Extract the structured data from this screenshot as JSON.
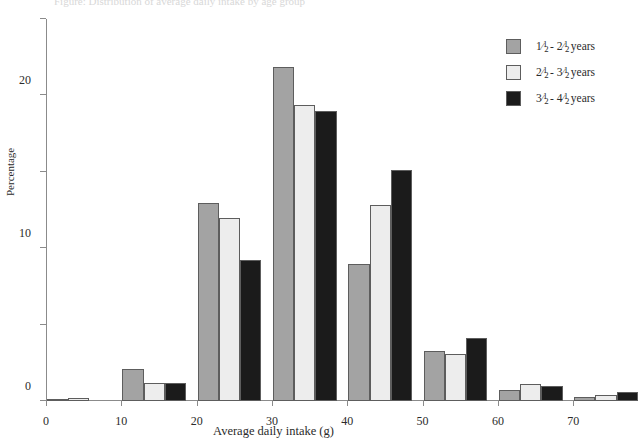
{
  "title_strip": "Figure: Distribution of average daily intake by age group",
  "axes": {
    "y_title": "Percentage",
    "x_title": "Average daily intake (g)",
    "y_ticks": [
      0,
      10,
      20,
      30,
      40,
      50
    ],
    "x_ticks": [
      0,
      10,
      20,
      30,
      40,
      50,
      60,
      70
    ]
  },
  "legend": {
    "items": [
      {
        "label": "1 1/2 - 2 1/2 years",
        "a_whole": "1",
        "a_num": "1",
        "a_den": "2",
        "b_whole": "2",
        "b_num": "1",
        "b_den": "2",
        "suffix": " years",
        "dash": " - ",
        "color": "#a3a3a3"
      },
      {
        "label": "2 1/2 - 3 1/2 years",
        "a_whole": "2",
        "a_num": "1",
        "a_den": "2",
        "b_whole": "3",
        "b_num": "1",
        "b_den": "2",
        "suffix": " years",
        "dash": " - ",
        "color": "#ededed"
      },
      {
        "label": "3 1/2 - 4 1/2 years",
        "a_whole": "3",
        "a_num": "1",
        "a_den": "2",
        "b_whole": "4",
        "b_num": "1",
        "b_den": "2",
        "suffix": " years",
        "dash": " - ",
        "color": "#1b1b1b"
      }
    ]
  },
  "chart_data": {
    "type": "bar",
    "title": "",
    "xlabel": "Average daily intake (g)",
    "ylabel": "Percentage",
    "ylim": [
      0,
      50
    ],
    "xlim": [
      0,
      77
    ],
    "grid": false,
    "legend_position": "top-right",
    "categories": [
      "0",
      "10",
      "20",
      "30",
      "40",
      "50",
      "60",
      "70"
    ],
    "category_left_edges": [
      0,
      10,
      20,
      30,
      40,
      50,
      60,
      70
    ],
    "series": [
      {
        "name": "1 1/2 - 2 1/2 years",
        "color": "#a3a3a3",
        "values": [
          0.3,
          4.2,
          25.9,
          43.7,
          17.9,
          6.6,
          1.5,
          0.5
        ]
      },
      {
        "name": "2 1/2 - 3 1/2 years",
        "color": "#ededed",
        "values": [
          0.4,
          2.4,
          24.0,
          38.8,
          25.6,
          6.2,
          2.2,
          0.8
        ]
      },
      {
        "name": "3 1/2 - 4 1/2 years",
        "color": "#1b1b1b",
        "values": [
          0.0,
          2.3,
          18.5,
          37.9,
          30.2,
          8.3,
          1.9,
          1.2
        ]
      }
    ]
  }
}
